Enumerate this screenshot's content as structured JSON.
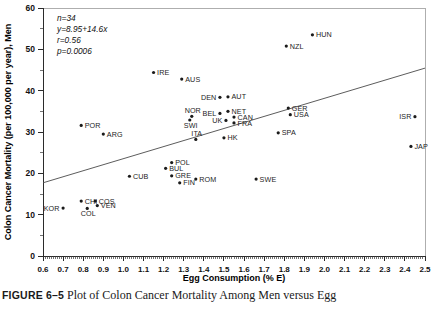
{
  "figure": {
    "caption_label": "FIGURE 6–5",
    "caption_text": "Plot of Colon Cancer Mortality Among Men versus Egg"
  },
  "stats": {
    "n": "n=34",
    "equation": "y=8.95+14.6x",
    "r": "r=0.56",
    "p": "p=0.0006"
  },
  "chart_data": {
    "type": "scatter",
    "title": "",
    "xlabel": "Egg Consumption (% E)",
    "ylabel": "Colon Cancer Mortality (per 100,000 per year), Men",
    "xlim": [
      0.6,
      2.5
    ],
    "ylim": [
      0,
      60
    ],
    "xticks": [
      0.6,
      0.7,
      0.8,
      0.9,
      1.0,
      1.1,
      1.2,
      1.3,
      1.4,
      1.5,
      1.6,
      1.7,
      1.8,
      1.9,
      2.0,
      2.1,
      2.2,
      2.3,
      2.4,
      2.5
    ],
    "xticklabels": [
      "0.6",
      "0.7",
      "0.8",
      "0.9",
      "1.0",
      "1.1",
      "1.2",
      "1.3",
      "1.4",
      "1.5",
      "1.6",
      "1.7",
      "1.8",
      "1.9",
      "2.0",
      "2.1",
      "2.2",
      "2.3",
      "2.4",
      "2.5"
    ],
    "yticks": [
      0,
      10,
      20,
      30,
      40,
      50,
      60
    ],
    "yticklabels": [
      "0",
      "10",
      "20",
      "30",
      "40",
      "50",
      "60"
    ],
    "minor_yticks": [
      5,
      15,
      25,
      35,
      45,
      55
    ],
    "grid": false,
    "legend": false,
    "n": 34,
    "r": 0.56,
    "p": 0.0006,
    "fit": {
      "type": "linear",
      "intercept": 8.95,
      "slope": 14.6,
      "equation": "y=8.95+14.6x",
      "x_start": 0.6,
      "x_end": 2.5,
      "y_start": 17.71,
      "y_end": 45.45
    },
    "points": [
      {
        "label": "POR",
        "x": 0.79,
        "y": 31.6,
        "label_pos": "right"
      },
      {
        "label": "ARG",
        "x": 0.9,
        "y": 29.5,
        "label_pos": "right"
      },
      {
        "label": "KOR",
        "x": 0.7,
        "y": 11.6,
        "label_pos": "left"
      },
      {
        "label": "CHI",
        "x": 0.79,
        "y": 13.3,
        "label_pos": "right"
      },
      {
        "label": "COL",
        "x": 0.82,
        "y": 11.5,
        "label_pos": "below"
      },
      {
        "label": "COS",
        "x": 0.86,
        "y": 13.3,
        "label_pos": "right"
      },
      {
        "label": "VEN",
        "x": 0.87,
        "y": 12.2,
        "label_pos": "right"
      },
      {
        "label": "CUB",
        "x": 1.03,
        "y": 19.3,
        "label_pos": "right"
      },
      {
        "label": "IRE",
        "x": 1.15,
        "y": 44.4,
        "label_pos": "right"
      },
      {
        "label": "POL",
        "x": 1.24,
        "y": 22.6,
        "label_pos": "right"
      },
      {
        "label": "BUL",
        "x": 1.21,
        "y": 21.2,
        "label_pos": "right"
      },
      {
        "label": "GRE",
        "x": 1.24,
        "y": 19.4,
        "label_pos": "right"
      },
      {
        "label": "FIN",
        "x": 1.28,
        "y": 17.7,
        "label_pos": "right"
      },
      {
        "label": "ROM",
        "x": 1.36,
        "y": 18.6,
        "label_pos": "right"
      },
      {
        "label": "AUS",
        "x": 1.29,
        "y": 42.8,
        "label_pos": "right"
      },
      {
        "label": "NOR",
        "x": 1.34,
        "y": 33.8,
        "label_pos": "above"
      },
      {
        "label": "SWI",
        "x": 1.33,
        "y": 32.9,
        "label_pos": "below"
      },
      {
        "label": "ITA",
        "x": 1.36,
        "y": 28.2,
        "label_pos": "above"
      },
      {
        "label": "DEN",
        "x": 1.48,
        "y": 38.4,
        "label_pos": "left"
      },
      {
        "label": "AUT",
        "x": 1.52,
        "y": 38.5,
        "label_pos": "right"
      },
      {
        "label": "BEL",
        "x": 1.48,
        "y": 34.5,
        "label_pos": "left"
      },
      {
        "label": "NET",
        "x": 1.52,
        "y": 35.0,
        "label_pos": "right"
      },
      {
        "label": "UK",
        "x": 1.51,
        "y": 32.8,
        "label_pos": "left"
      },
      {
        "label": "CAN",
        "x": 1.55,
        "y": 33.6,
        "label_pos": "right"
      },
      {
        "label": "FRA",
        "x": 1.55,
        "y": 32.2,
        "label_pos": "right"
      },
      {
        "label": "HK",
        "x": 1.5,
        "y": 28.6,
        "label_pos": "right"
      },
      {
        "label": "SWE",
        "x": 1.66,
        "y": 18.6,
        "label_pos": "right"
      },
      {
        "label": "SPA",
        "x": 1.77,
        "y": 29.8,
        "label_pos": "right"
      },
      {
        "label": "GER",
        "x": 1.82,
        "y": 35.8,
        "label_pos": "right"
      },
      {
        "label": "USA",
        "x": 1.83,
        "y": 34.2,
        "label_pos": "right"
      },
      {
        "label": "NZL",
        "x": 1.81,
        "y": 50.8,
        "label_pos": "right"
      },
      {
        "label": "HUN",
        "x": 1.94,
        "y": 53.5,
        "label_pos": "right"
      },
      {
        "label": "ISR",
        "x": 2.45,
        "y": 33.7,
        "label_pos": "left"
      },
      {
        "label": "JAP",
        "x": 2.43,
        "y": 26.5,
        "label_pos": "right"
      }
    ]
  }
}
